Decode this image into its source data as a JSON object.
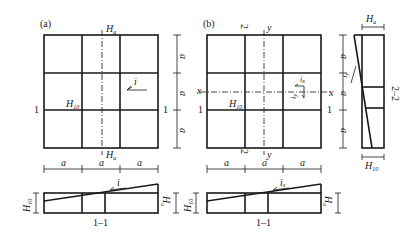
{
  "panels": {
    "a": {
      "label": "(a)",
      "top_label": "H",
      "top_label_sub": "a",
      "bottom_label": "H",
      "bottom_label_sub": "a",
      "center_label": "H",
      "center_label_sub": "10",
      "slope_label": "i",
      "section_marker_left": "1",
      "section_marker_right": "1",
      "dim_right": [
        "a",
        "a",
        "a"
      ],
      "dim_bottom": [
        "a",
        "a",
        "a"
      ]
    },
    "b": {
      "label": "(b)",
      "top_marker_2": "2",
      "top_axis_y": "y",
      "bottom_marker_2": "2",
      "bottom_axis_y": "y",
      "axis_x_left": "x",
      "axis_x_right": "x",
      "center_label": "H",
      "center_label_sub": "10",
      "slope_x": "i",
      "slope_x_sub": "x",
      "slope_y": "i",
      "slope_y_sub": "y",
      "section_marker_left": "1",
      "section_marker_right": "1",
      "dim_right": [
        "a",
        "a",
        "a"
      ],
      "dim_bottom": [
        "a",
        "a",
        "a"
      ]
    },
    "section_1_1_a": {
      "title": "1–1",
      "left_dim": "H",
      "left_dim_sub": "10",
      "right_dim": "H",
      "right_dim_sub": "a",
      "slope_label": "i"
    },
    "section_1_1_b": {
      "title": "1–1",
      "left_dim": "H",
      "left_dim_sub": "10",
      "right_dim": "H",
      "right_dim_sub": "a",
      "slope_label": "i",
      "slope_label_sub": "x"
    },
    "section_2_2": {
      "title": "2–2",
      "top_dim": "H",
      "top_dim_sub": "a",
      "bottom_dim": "H",
      "bottom_dim_sub": "10",
      "slope_label": "i",
      "slope_label_sub": "y"
    }
  }
}
